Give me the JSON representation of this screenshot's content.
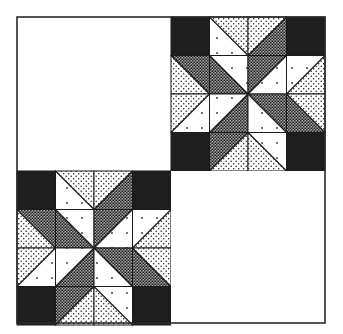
{
  "figure": {
    "title": "",
    "type": "quilt-layout",
    "layout": {
      "outer": {
        "x": 17,
        "y": 17,
        "size": 308
      },
      "grid": [
        [
          "plain",
          "star"
        ],
        [
          "star",
          "plain"
        ]
      ]
    },
    "colors": {
      "background": "#ffffff",
      "border": "#2a2a2a",
      "black": "#1e1e1e",
      "white": "#ffffff",
      "dot": "#1a1a1a"
    },
    "fabrics": {
      "K": "solid-black",
      "W": "white-with-sparse-dots",
      "L": "light-dot-print",
      "D": "dark-dense-dot-print"
    },
    "star_block": {
      "size_cells": 4,
      "cells": [
        [
          {
            "t": "K"
          },
          {
            "t": "tri",
            "diag": "\\",
            "a": "L",
            "b": "W"
          },
          {
            "t": "tri",
            "diag": "/",
            "a": "L",
            "b": "D"
          },
          {
            "t": "K"
          }
        ],
        [
          {
            "t": "tri",
            "diag": "\\",
            "a": "D",
            "b": "L"
          },
          {
            "t": "tri",
            "diag": "\\",
            "a": "W",
            "b": "D"
          },
          {
            "t": "tri",
            "diag": "/",
            "a": "D",
            "b": "W"
          },
          {
            "t": "tri",
            "diag": "/",
            "a": "W",
            "b": "L"
          }
        ],
        [
          {
            "t": "tri",
            "diag": "/",
            "a": "L",
            "b": "W"
          },
          {
            "t": "tri",
            "diag": "/",
            "a": "W",
            "b": "D"
          },
          {
            "t": "tri",
            "diag": "\\",
            "a": "D",
            "b": "W"
          },
          {
            "t": "tri",
            "diag": "\\",
            "a": "L",
            "b": "D"
          }
        ],
        [
          {
            "t": "K"
          },
          {
            "t": "tri",
            "diag": "/",
            "a": "D",
            "b": "L"
          },
          {
            "t": "tri",
            "diag": "\\",
            "a": "W",
            "b": "L"
          },
          {
            "t": "K"
          }
        ]
      ],
      "note": "diag '\\\\' runs top-left to bottom-right: a = upper-right triangle, b = lower-left triangle; diag '/' runs top-right to bottom-left: a = upper-left triangle, b = lower-right triangle"
    }
  }
}
